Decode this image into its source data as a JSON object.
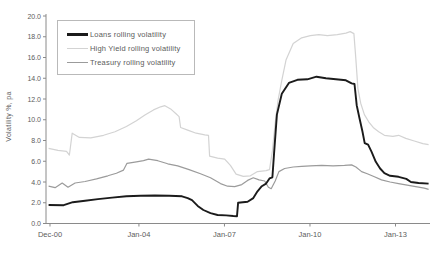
{
  "colors": {
    "background": "#ffffff",
    "axis": "#8a8a8a",
    "tick_text": "#5c5c5c",
    "legend_border": "#b9b9b9",
    "loans": "#1b1b1b",
    "high_yield": "#d3d3d3",
    "treasury": "#9b9b9b"
  },
  "chart_data": {
    "type": "line",
    "title": "",
    "xlabel": "",
    "ylabel": "Volatility %, pa",
    "grid": false,
    "legend_position": "top-left",
    "xlim": [
      2000.78,
      2014.25
    ],
    "ylim": [
      0,
      20
    ],
    "y_ticks": [
      {
        "v": 0,
        "label": "0.0"
      },
      {
        "v": 2,
        "label": "2.0"
      },
      {
        "v": 4,
        "label": "4.0"
      },
      {
        "v": 6,
        "label": "6.0"
      },
      {
        "v": 8,
        "label": "8.0"
      },
      {
        "v": 10,
        "label": "10.0"
      },
      {
        "v": 12,
        "label": "12.0"
      },
      {
        "v": 14,
        "label": "14.0"
      },
      {
        "v": 16,
        "label": "16.0"
      },
      {
        "v": 18,
        "label": "18.0"
      },
      {
        "v": 20,
        "label": "20.0"
      }
    ],
    "x_ticks": [
      {
        "t": 2000.92,
        "label": "Dec-00"
      },
      {
        "t": 2004.04,
        "label": "Jan-04"
      },
      {
        "t": 2007.04,
        "label": "Jan-07"
      },
      {
        "t": 2010.04,
        "label": "Jan-10"
      },
      {
        "t": 2013.04,
        "label": "Jan-13"
      }
    ],
    "series": [
      {
        "name": "Loans rolling volatility",
        "color_key": "loans",
        "stroke_width": 1.9,
        "points": [
          [
            2000.87,
            1.78
          ],
          [
            2001.4,
            1.76
          ],
          [
            2001.72,
            2.05
          ],
          [
            2002.15,
            2.2
          ],
          [
            2002.6,
            2.35
          ],
          [
            2003.1,
            2.5
          ],
          [
            2003.6,
            2.62
          ],
          [
            2004.1,
            2.68
          ],
          [
            2004.6,
            2.7
          ],
          [
            2005.1,
            2.68
          ],
          [
            2005.55,
            2.62
          ],
          [
            2005.75,
            2.45
          ],
          [
            2005.9,
            2.25
          ],
          [
            2006.1,
            1.7
          ],
          [
            2006.3,
            1.3
          ],
          [
            2006.55,
            1.0
          ],
          [
            2006.8,
            0.82
          ],
          [
            2007.1,
            0.78
          ],
          [
            2007.35,
            0.72
          ],
          [
            2007.48,
            0.7
          ],
          [
            2007.52,
            2.0
          ],
          [
            2007.85,
            2.1
          ],
          [
            2008.05,
            2.45
          ],
          [
            2008.2,
            3.1
          ],
          [
            2008.35,
            3.6
          ],
          [
            2008.5,
            3.85
          ],
          [
            2008.62,
            4.35
          ],
          [
            2008.72,
            4.45
          ],
          [
            2008.78,
            6.8
          ],
          [
            2008.88,
            10.5
          ],
          [
            2009.05,
            12.5
          ],
          [
            2009.3,
            13.55
          ],
          [
            2009.6,
            13.85
          ],
          [
            2009.95,
            13.9
          ],
          [
            2010.27,
            14.15
          ],
          [
            2010.6,
            14.0
          ],
          [
            2010.95,
            13.9
          ],
          [
            2011.3,
            13.8
          ],
          [
            2011.5,
            13.5
          ],
          [
            2011.6,
            13.45
          ],
          [
            2011.68,
            11.4
          ],
          [
            2011.78,
            10.1
          ],
          [
            2011.88,
            8.9
          ],
          [
            2011.96,
            7.75
          ],
          [
            2012.08,
            7.6
          ],
          [
            2012.2,
            6.9
          ],
          [
            2012.35,
            5.95
          ],
          [
            2012.5,
            5.3
          ],
          [
            2012.65,
            4.85
          ],
          [
            2012.85,
            4.6
          ],
          [
            2013.15,
            4.5
          ],
          [
            2013.42,
            4.3
          ],
          [
            2013.58,
            4.0
          ],
          [
            2013.85,
            3.9
          ],
          [
            2014.2,
            3.85
          ]
        ]
      },
      {
        "name": "High Yield rolling volatility",
        "color_key": "high_yield",
        "stroke_width": 1.2,
        "points": [
          [
            2000.87,
            7.25
          ],
          [
            2001.2,
            7.05
          ],
          [
            2001.5,
            6.95
          ],
          [
            2001.6,
            6.6
          ],
          [
            2001.7,
            8.7
          ],
          [
            2001.95,
            8.3
          ],
          [
            2002.35,
            8.25
          ],
          [
            2002.8,
            8.5
          ],
          [
            2003.2,
            8.85
          ],
          [
            2003.6,
            9.35
          ],
          [
            2003.95,
            9.9
          ],
          [
            2004.25,
            10.45
          ],
          [
            2004.55,
            10.95
          ],
          [
            2004.8,
            11.25
          ],
          [
            2004.95,
            11.35
          ],
          [
            2005.15,
            11.05
          ],
          [
            2005.35,
            10.55
          ],
          [
            2005.45,
            10.3
          ],
          [
            2005.5,
            9.25
          ],
          [
            2005.75,
            9.0
          ],
          [
            2006.05,
            8.7
          ],
          [
            2006.35,
            8.55
          ],
          [
            2006.48,
            8.5
          ],
          [
            2006.52,
            6.5
          ],
          [
            2006.8,
            6.3
          ],
          [
            2007.05,
            6.2
          ],
          [
            2007.25,
            5.6
          ],
          [
            2007.45,
            4.75
          ],
          [
            2007.7,
            4.55
          ],
          [
            2007.95,
            4.6
          ],
          [
            2008.2,
            5.0
          ],
          [
            2008.5,
            5.1
          ],
          [
            2008.62,
            5.2
          ],
          [
            2008.72,
            7.0
          ],
          [
            2008.82,
            9.7
          ],
          [
            2008.92,
            11.9
          ],
          [
            2009.05,
            13.8
          ],
          [
            2009.2,
            15.75
          ],
          [
            2009.45,
            17.35
          ],
          [
            2009.75,
            17.9
          ],
          [
            2010.05,
            18.1
          ],
          [
            2010.35,
            18.2
          ],
          [
            2010.65,
            18.1
          ],
          [
            2011.0,
            18.2
          ],
          [
            2011.3,
            18.35
          ],
          [
            2011.45,
            18.5
          ],
          [
            2011.58,
            18.3
          ],
          [
            2011.65,
            15.8
          ],
          [
            2011.72,
            13.0
          ],
          [
            2011.82,
            11.6
          ],
          [
            2011.95,
            10.5
          ],
          [
            2012.1,
            9.8
          ],
          [
            2012.28,
            9.2
          ],
          [
            2012.45,
            8.85
          ],
          [
            2012.65,
            8.5
          ],
          [
            2012.95,
            8.4
          ],
          [
            2013.15,
            8.5
          ],
          [
            2013.4,
            8.2
          ],
          [
            2013.7,
            7.95
          ],
          [
            2014.0,
            7.7
          ],
          [
            2014.2,
            7.6
          ]
        ]
      },
      {
        "name": "Treasury rolling volatility",
        "color_key": "treasury",
        "stroke_width": 1.2,
        "points": [
          [
            2000.87,
            3.6
          ],
          [
            2001.1,
            3.45
          ],
          [
            2001.35,
            3.9
          ],
          [
            2001.55,
            3.5
          ],
          [
            2001.8,
            3.9
          ],
          [
            2002.15,
            4.05
          ],
          [
            2002.55,
            4.3
          ],
          [
            2002.95,
            4.6
          ],
          [
            2003.25,
            4.85
          ],
          [
            2003.5,
            5.15
          ],
          [
            2003.62,
            5.8
          ],
          [
            2003.95,
            5.95
          ],
          [
            2004.2,
            6.05
          ],
          [
            2004.38,
            6.2
          ],
          [
            2004.7,
            6.05
          ],
          [
            2005.05,
            5.75
          ],
          [
            2005.4,
            5.55
          ],
          [
            2005.8,
            5.2
          ],
          [
            2006.2,
            4.8
          ],
          [
            2006.55,
            4.4
          ],
          [
            2006.9,
            3.85
          ],
          [
            2007.15,
            3.6
          ],
          [
            2007.4,
            3.55
          ],
          [
            2007.65,
            3.75
          ],
          [
            2007.85,
            4.15
          ],
          [
            2008.05,
            4.4
          ],
          [
            2008.25,
            4.2
          ],
          [
            2008.45,
            4.1
          ],
          [
            2008.58,
            3.5
          ],
          [
            2008.68,
            3.35
          ],
          [
            2008.82,
            4.1
          ],
          [
            2008.95,
            5.0
          ],
          [
            2009.15,
            5.3
          ],
          [
            2009.45,
            5.45
          ],
          [
            2009.75,
            5.5
          ],
          [
            2010.05,
            5.55
          ],
          [
            2010.45,
            5.6
          ],
          [
            2010.85,
            5.55
          ],
          [
            2011.25,
            5.6
          ],
          [
            2011.5,
            5.65
          ],
          [
            2011.65,
            5.45
          ],
          [
            2011.85,
            5.0
          ],
          [
            2012.05,
            4.8
          ],
          [
            2012.3,
            4.5
          ],
          [
            2012.55,
            4.2
          ],
          [
            2012.85,
            4.0
          ],
          [
            2013.15,
            3.85
          ],
          [
            2013.45,
            3.7
          ],
          [
            2013.75,
            3.55
          ],
          [
            2014.05,
            3.4
          ],
          [
            2014.2,
            3.3
          ]
        ]
      }
    ]
  }
}
